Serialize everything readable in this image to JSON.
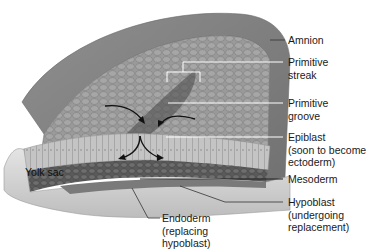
{
  "diagram": {
    "labels": {
      "amnion": "Amnion",
      "primitive_streak": "Primitive\nstreak",
      "primitive_groove": "Primitive\ngroove",
      "epiblast": "Epiblast\n(soon to become\nectoderm)",
      "mesoderm": "Mesoderm",
      "hypoblast": "Hypoblast\n(undergoing\nreplacement)",
      "endoderm": "Endoderm\n(replacing\nhypoblast)",
      "yolk_sac": "Yolk sac"
    },
    "arrows": [
      {
        "name": "cell-migration-arrow-left-top",
        "meaning": "epiblast cells converging toward primitive groove"
      },
      {
        "name": "cell-migration-arrow-right-top",
        "meaning": "epiblast cells converging toward primitive groove"
      },
      {
        "name": "cell-migration-arrow-left-bottom",
        "meaning": "cells ingressing to form endoderm"
      },
      {
        "name": "cell-migration-arrow-right-bottom",
        "meaning": "cells ingressing to form mesoderm"
      }
    ],
    "colors": {
      "background": "#ffffff",
      "amnion": "#8a8a8a",
      "epiblast_surface": "#9a9a9a",
      "epiblast_edge": "#c8c8c8",
      "mesoderm": "#5e5e5e",
      "yolk_sac": "#d6d6d6",
      "leader_lines": "#ffffff",
      "label_lines": "#333333",
      "arrows": "#111111"
    }
  }
}
